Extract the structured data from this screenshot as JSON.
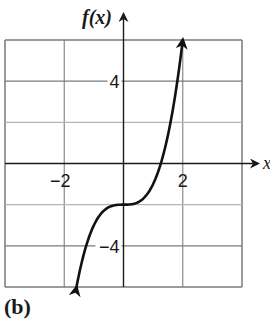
{
  "caption": "(b)",
  "chart_data": {
    "type": "line",
    "title": "",
    "xlabel": "x",
    "ylabel": "f(x)",
    "function": "f(x) = x^3 - 2",
    "xlim": [
      -4,
      4
    ],
    "ylim": [
      -6,
      6
    ],
    "grid": true,
    "x_gridlines": [
      -4,
      -2,
      0,
      2,
      4
    ],
    "y_gridlines": [
      -6,
      -4,
      -2,
      0,
      2,
      4,
      6
    ],
    "x_tick_labels": [
      {
        "value": -2,
        "label": "−2"
      },
      {
        "value": 2,
        "label": "2"
      }
    ],
    "y_tick_labels": [
      {
        "value": 4,
        "label": "4"
      },
      {
        "value": -4,
        "label": "−4"
      }
    ],
    "series": [
      {
        "name": "f(x)",
        "x": [
          -1.59,
          -1.5,
          -1.25,
          -1.0,
          -0.75,
          -0.5,
          -0.25,
          0,
          0.25,
          0.5,
          0.75,
          1.0,
          1.25,
          1.5,
          1.75,
          2.0
        ],
        "y": [
          -6.0,
          -5.38,
          -3.95,
          -3.0,
          -2.42,
          -2.13,
          -2.02,
          -2.0,
          -1.98,
          -1.88,
          -1.58,
          -1.0,
          -0.05,
          1.38,
          3.36,
          6.0
        ],
        "arrow_ends": true
      }
    ],
    "legend": null
  },
  "colors": {
    "grid": "#8a8a8a",
    "axis": "#1a1a1a",
    "curve": "#111111",
    "text": "#1a1a1a"
  }
}
